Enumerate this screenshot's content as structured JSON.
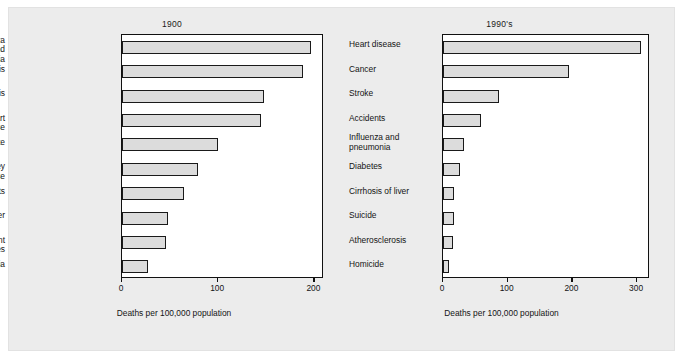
{
  "figure": {
    "background_color": "#ececec",
    "plot_background_color": "#ffffff",
    "bar_fill_color": "#dcdcdc",
    "bar_edge_color": "#1a1a1a",
    "axis_caption": "Deaths per 100,000 population"
  },
  "chart_data": [
    {
      "type": "bar",
      "orientation": "horizontal",
      "title": "1900",
      "xlabel": "Deaths per 100,000 population",
      "ylabel": "",
      "xlim": [
        0,
        210
      ],
      "xticks": [
        0,
        100,
        200
      ],
      "xticklabels": [
        "0",
        "100",
        "200"
      ],
      "grid": false,
      "legend": null,
      "categories": [
        "Influenza and\npneumonia",
        "Tuberculosis",
        "Gastroenteritis",
        "Heart disease",
        "Stroke",
        "Kidney disease",
        "Accidents",
        "Cancer",
        "Infant diseases",
        "Diphtheria"
      ],
      "values": [
        197,
        188,
        148,
        145,
        100,
        79,
        64,
        48,
        46,
        27
      ]
    },
    {
      "type": "bar",
      "orientation": "horizontal",
      "title": "1990's",
      "xlabel": "Deaths per 100,000 population",
      "ylabel": "",
      "xlim": [
        0,
        320
      ],
      "xticks": [
        0,
        100,
        200,
        300
      ],
      "xticklabels": [
        "0",
        "100",
        "200",
        "300"
      ],
      "grid": false,
      "legend": null,
      "categories": [
        "Heart disease",
        "Cancer",
        "Stroke",
        "Accidents",
        "Influenza and\npneumonia",
        "Diabetes",
        "Cirrhosis of liver",
        "Suicide",
        "Atherosclerosis",
        "Homicide"
      ],
      "values": [
        306,
        195,
        86,
        58,
        32,
        27,
        17,
        17,
        15,
        10
      ]
    }
  ]
}
